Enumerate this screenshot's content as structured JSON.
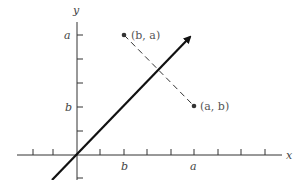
{
  "diagram": {
    "axes": {
      "x_label": "x",
      "y_label": "y"
    },
    "tick_labels": {
      "x_b": "b",
      "x_a": "a",
      "y_b": "b",
      "y_a": "a"
    },
    "points": [
      {
        "name": "point-b-a",
        "label": "(b, a)",
        "x": "b",
        "y": "a"
      },
      {
        "name": "point-a-b",
        "label": "(a, b)",
        "x": "a",
        "y": "b"
      }
    ],
    "line": {
      "equation": "y = x",
      "style": "solid-arrow"
    },
    "connector": {
      "style": "dashed",
      "from": "(b, a)",
      "to": "(a, b)"
    },
    "colors": {
      "ink": "#111111",
      "label": "#444444"
    }
  }
}
